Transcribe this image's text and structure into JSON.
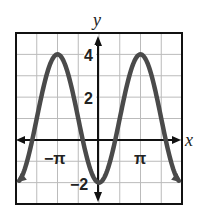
{
  "chart_data": {
    "type": "line",
    "title": "",
    "xlabel": "x",
    "ylabel": "y",
    "function": "y = 1 - 3cos(x)",
    "xlim": [
      -6.2832,
      6.2832
    ],
    "ylim": [
      -3,
      5
    ],
    "grid": true,
    "grid_x_step": "π/2",
    "grid_y_step": 1,
    "x_tick_labels": [
      {
        "value": -3.14159,
        "label": "−π"
      },
      {
        "value": 3.14159,
        "label": "π"
      }
    ],
    "y_tick_labels": [
      {
        "value": 4,
        "label": "4"
      },
      {
        "value": 2,
        "label": "2"
      },
      {
        "value": -2,
        "label": "−2"
      }
    ],
    "series": [
      {
        "name": "curve",
        "x": [
          -6.2832,
          -4.7124,
          -3.1416,
          -1.5708,
          0,
          1.5708,
          3.1416,
          4.7124,
          6.2832
        ],
        "values": [
          -2,
          1,
          4,
          1,
          -2,
          1,
          4,
          1,
          -2
        ]
      }
    ],
    "colors": {
      "curve": "#4a4a4a",
      "axes": "#111111",
      "grid": "#bbbbbb",
      "frame": "#111111"
    }
  },
  "labels": {
    "x_axis": "x",
    "y_axis": "y",
    "neg_pi": "−π",
    "pi": "π",
    "y4": "4",
    "y2": "2",
    "yneg2": "−2"
  }
}
